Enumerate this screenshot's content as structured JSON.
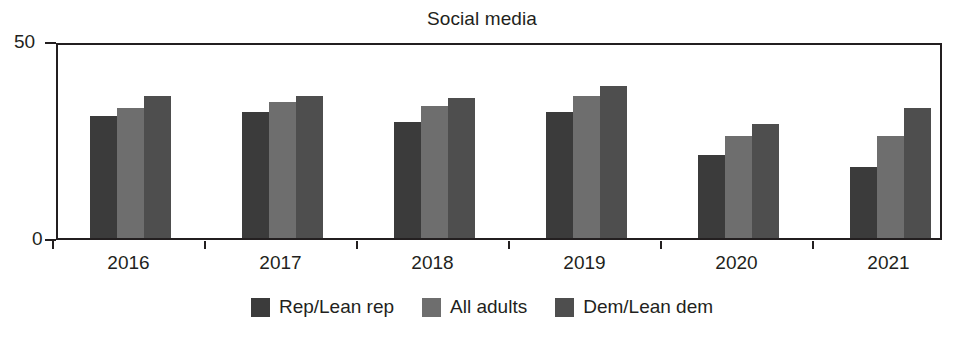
{
  "chart_data": {
    "type": "bar",
    "title": "Social media",
    "xlabel": "",
    "ylabel": "",
    "ylim": [
      0,
      50
    ],
    "ytick_labels": [
      "50",
      "0"
    ],
    "ytick_values": [
      50,
      0
    ],
    "grid": false,
    "legend_position": "bottom",
    "categories": [
      "2016",
      "2017",
      "2018",
      "2019",
      "2020",
      "2021"
    ],
    "series": [
      {
        "name": "Rep/Lean rep",
        "color": "#3b3b3b",
        "values": [
          31,
          32,
          29.5,
          32,
          21,
          18
        ]
      },
      {
        "name": "All adults",
        "color": "#6e6e6e",
        "values": [
          33,
          34.5,
          33.5,
          36,
          26,
          26
        ]
      },
      {
        "name": "Dem/Lean dem",
        "color": "#4e4e4e",
        "values": [
          36,
          36,
          35.5,
          38.5,
          29,
          33
        ]
      }
    ]
  }
}
